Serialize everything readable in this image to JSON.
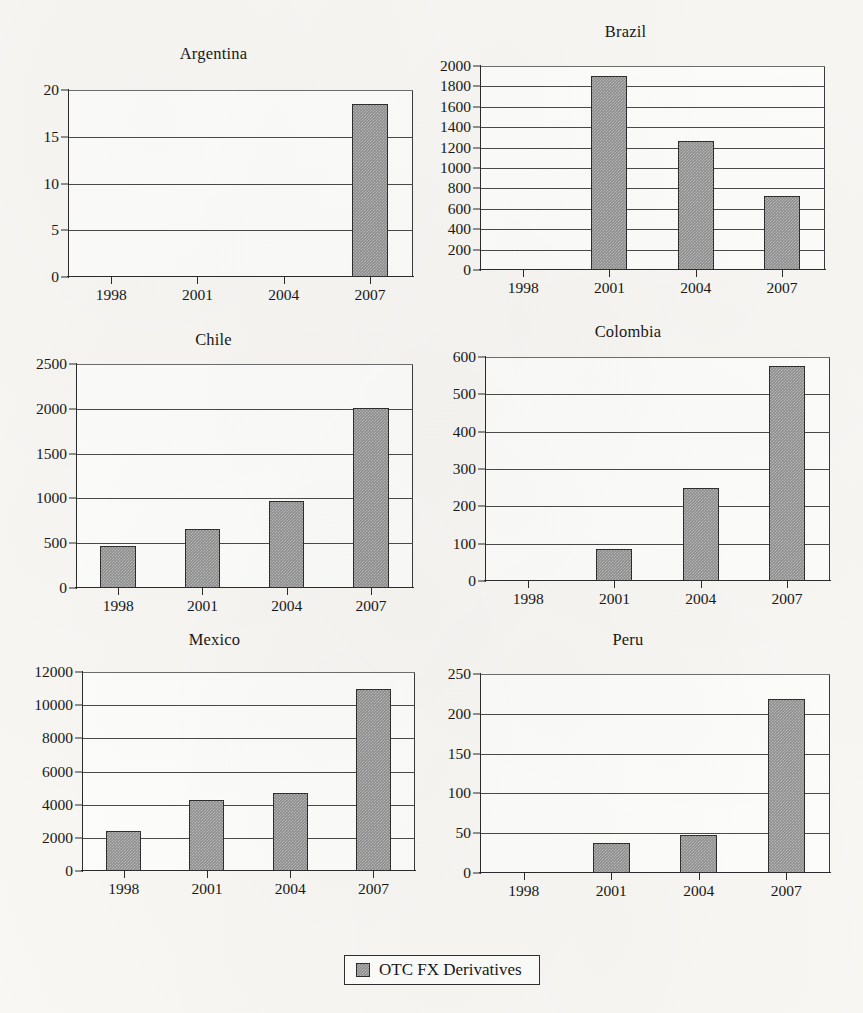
{
  "figure": {
    "background_color": "#f8f7f4",
    "bar_color": "#8e8e8e",
    "axis_color": "#2b2b2b",
    "legend": {
      "label": "OTC FX Derivatives",
      "swatch_name": "legend-swatch"
    }
  },
  "chart_data": [
    {
      "type": "bar",
      "title": "Argentina",
      "xlabel": "",
      "ylabel": "",
      "categories": [
        "1998",
        "2001",
        "2004",
        "2007"
      ],
      "values": [
        0,
        0,
        0,
        18.5
      ],
      "ylim": [
        0,
        20
      ],
      "yticks": [
        0,
        5,
        10,
        15,
        20
      ],
      "ytick_labels": [
        "0",
        "5",
        "10",
        "15",
        "20"
      ],
      "grid": true,
      "legend": "OTC FX Derivatives",
      "legend_position": "bottom-center-shared",
      "series": [
        {
          "name": "OTC FX Derivatives",
          "values": [
            0,
            0,
            0,
            18.5
          ]
        }
      ]
    },
    {
      "type": "bar",
      "title": "Brazil",
      "xlabel": "",
      "ylabel": "",
      "categories": [
        "1998",
        "2001",
        "2004",
        "2007"
      ],
      "values": [
        0,
        1900,
        1265,
        725
      ],
      "ylim": [
        0,
        2000
      ],
      "yticks": [
        0,
        200,
        400,
        600,
        800,
        1000,
        1200,
        1400,
        1600,
        1800,
        2000
      ],
      "ytick_labels": [
        "0",
        "200",
        "400",
        "600",
        "800",
        "1000",
        "1200",
        "1400",
        "1600",
        "1800",
        "2000"
      ],
      "grid": true,
      "legend": "OTC FX Derivatives",
      "legend_position": "bottom-center-shared",
      "series": [
        {
          "name": "OTC FX Derivatives",
          "values": [
            0,
            1900,
            1265,
            725
          ]
        }
      ]
    },
    {
      "type": "bar",
      "title": "Chile",
      "xlabel": "",
      "ylabel": "",
      "categories": [
        "1998",
        "2001",
        "2004",
        "2007"
      ],
      "values": [
        465,
        655,
        975,
        2010
      ],
      "ylim": [
        0,
        2500
      ],
      "yticks": [
        0,
        500,
        1000,
        1500,
        2000,
        2500
      ],
      "ytick_labels": [
        "0",
        "500",
        "1000",
        "1500",
        "2000",
        "2500"
      ],
      "grid": true,
      "legend": "OTC FX Derivatives",
      "legend_position": "bottom-center-shared",
      "series": [
        {
          "name": "OTC FX Derivatives",
          "values": [
            465,
            655,
            975,
            2010
          ]
        }
      ]
    },
    {
      "type": "bar",
      "title": "Colombia",
      "xlabel": "",
      "ylabel": "",
      "categories": [
        "1998",
        "2001",
        "2004",
        "2007"
      ],
      "values": [
        0,
        85,
        250,
        575
      ],
      "ylim": [
        0,
        600
      ],
      "yticks": [
        0,
        100,
        200,
        300,
        400,
        500,
        600
      ],
      "ytick_labels": [
        "0",
        "100",
        "200",
        "300",
        "400",
        "500",
        "600"
      ],
      "grid": true,
      "legend": "OTC FX Derivatives",
      "legend_position": "bottom-center-shared",
      "series": [
        {
          "name": "OTC FX Derivatives",
          "values": [
            0,
            85,
            250,
            575
          ]
        }
      ]
    },
    {
      "type": "bar",
      "title": "Mexico",
      "xlabel": "",
      "ylabel": "",
      "categories": [
        "1998",
        "2001",
        "2004",
        "2007"
      ],
      "values": [
        2400,
        4280,
        4680,
        11000
      ],
      "ylim": [
        0,
        12000
      ],
      "yticks": [
        0,
        2000,
        4000,
        6000,
        8000,
        10000,
        12000
      ],
      "ytick_labels": [
        "0",
        "2000",
        "4000",
        "6000",
        "8000",
        "10000",
        "12000"
      ],
      "grid": true,
      "legend": "OTC FX Derivatives",
      "legend_position": "bottom-center-shared",
      "series": [
        {
          "name": "OTC FX Derivatives",
          "values": [
            2400,
            4280,
            4680,
            11000
          ]
        }
      ]
    },
    {
      "type": "bar",
      "title": "Peru",
      "xlabel": "",
      "ylabel": "",
      "categories": [
        "1998",
        "2001",
        "2004",
        "2007"
      ],
      "values": [
        0,
        38,
        48,
        218
      ],
      "ylim": [
        0,
        250
      ],
      "yticks": [
        0,
        50,
        100,
        150,
        200,
        250
      ],
      "ytick_labels": [
        "0",
        "50",
        "100",
        "150",
        "200",
        "250"
      ],
      "grid": true,
      "legend": "OTC FX Derivatives",
      "legend_position": "bottom-center-shared",
      "series": [
        {
          "name": "OTC FX Derivatives",
          "values": [
            0,
            38,
            48,
            218
          ]
        }
      ]
    }
  ],
  "layout": {
    "panels": [
      {
        "key": "argentina",
        "left": 14,
        "top": 44,
        "plot_left": 68,
        "plot_top": 90,
        "plot_width": 345,
        "plot_height": 187
      },
      {
        "key": "brazil",
        "left": 426,
        "top": 22,
        "plot_left": 480,
        "plot_top": 66,
        "plot_width": 345,
        "plot_height": 204
      },
      {
        "key": "chile",
        "left": 14,
        "top": 330,
        "plot_left": 76,
        "plot_top": 364,
        "plot_width": 337,
        "plot_height": 224
      },
      {
        "key": "colombia",
        "left": 426,
        "top": 322,
        "plot_left": 485,
        "plot_top": 357,
        "plot_width": 345,
        "plot_height": 224
      },
      {
        "key": "mexico",
        "left": 14,
        "top": 630,
        "plot_left": 82,
        "plot_top": 672,
        "plot_width": 333,
        "plot_height": 199
      },
      {
        "key": "peru",
        "left": 426,
        "top": 630,
        "plot_left": 480,
        "plot_top": 674,
        "plot_width": 350,
        "plot_height": 199
      }
    ],
    "legend_box": {
      "left": 344,
      "top": 955,
      "width": 196,
      "height": 30
    }
  }
}
